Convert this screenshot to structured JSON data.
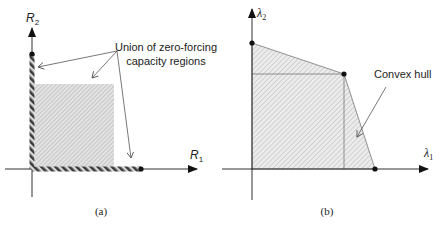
{
  "panels": [
    {
      "id": "a",
      "caption": "(a)",
      "axes": {
        "y_label": "R",
        "y_sub": "2",
        "x_label": "R",
        "x_sub": "1"
      },
      "annotation": {
        "line1": "Union of zero-forcing",
        "line2": "capacity regions"
      }
    },
    {
      "id": "b",
      "caption": "(b)",
      "axes": {
        "y_label": "λ",
        "y_sub": "2",
        "x_label": "λ",
        "x_sub": "1"
      },
      "annotation": {
        "line1": "Convex hull"
      }
    }
  ],
  "colors": {
    "axis": "#1a1a1a",
    "hatch": "#555555",
    "fill_a": "#d9d9d9",
    "fill_b": "#e6e6e6",
    "leader": "#555555",
    "text": "#222222"
  }
}
